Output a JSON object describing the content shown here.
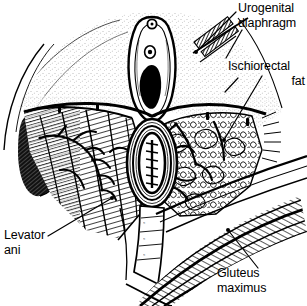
{
  "figure": {
    "kind": "anatomical-line-drawing",
    "style": "black-and-white pen-and-ink hatching engraving",
    "background_color": "#ffffff",
    "ink_color": "#000000"
  },
  "labels": {
    "urogenital_diaphragm": {
      "line1": "Urogenital",
      "line2": "diaphragm"
    },
    "ischiorectal_fat": {
      "line1": "Ischiorectal",
      "line2": "fat"
    },
    "levator_ani": {
      "line1": "Levator",
      "line2": "ani"
    },
    "gluteus_maximus": {
      "line1": "Gluteus",
      "line2": "maximus"
    }
  },
  "structures": [
    {
      "name": "vulva-introitus",
      "note": "vaginal opening at top center, dark lumen"
    },
    {
      "name": "anal-canal",
      "note": "central oval with suture marks, surrounded by sphincter rings"
    },
    {
      "name": "ischiorectal-fat",
      "note": "lobulated fat pad, right side of field"
    },
    {
      "name": "levator-ani",
      "note": "striated muscle sheet, left side of field, with vessel branches"
    },
    {
      "name": "gluteus-maximus",
      "note": "curved parallel muscle bands, lower right"
    },
    {
      "name": "urogenital-diaphragm",
      "note": "hatched band retracted at upper right"
    },
    {
      "name": "anococcygeal-raphe",
      "note": "midline band below anus"
    },
    {
      "name": "skin-flap",
      "note": "stippled perineal skin, upper field"
    },
    {
      "name": "ischiorectal-fossa-shadow",
      "note": "dark recess at left"
    }
  ],
  "leader_lines": [
    {
      "from": "urogenital_diaphragm",
      "to": "urogenital-diaphragm",
      "endpoint": "dot"
    },
    {
      "from": "ischiorectal_fat",
      "to": "ischiorectal-fat",
      "endpoint": "dot"
    },
    {
      "from": "levator_ani",
      "to": "levator-ani",
      "endpoint": "dot"
    },
    {
      "from": "gluteus_maximus",
      "to": "gluteus-maximus",
      "endpoint": "dot"
    }
  ]
}
